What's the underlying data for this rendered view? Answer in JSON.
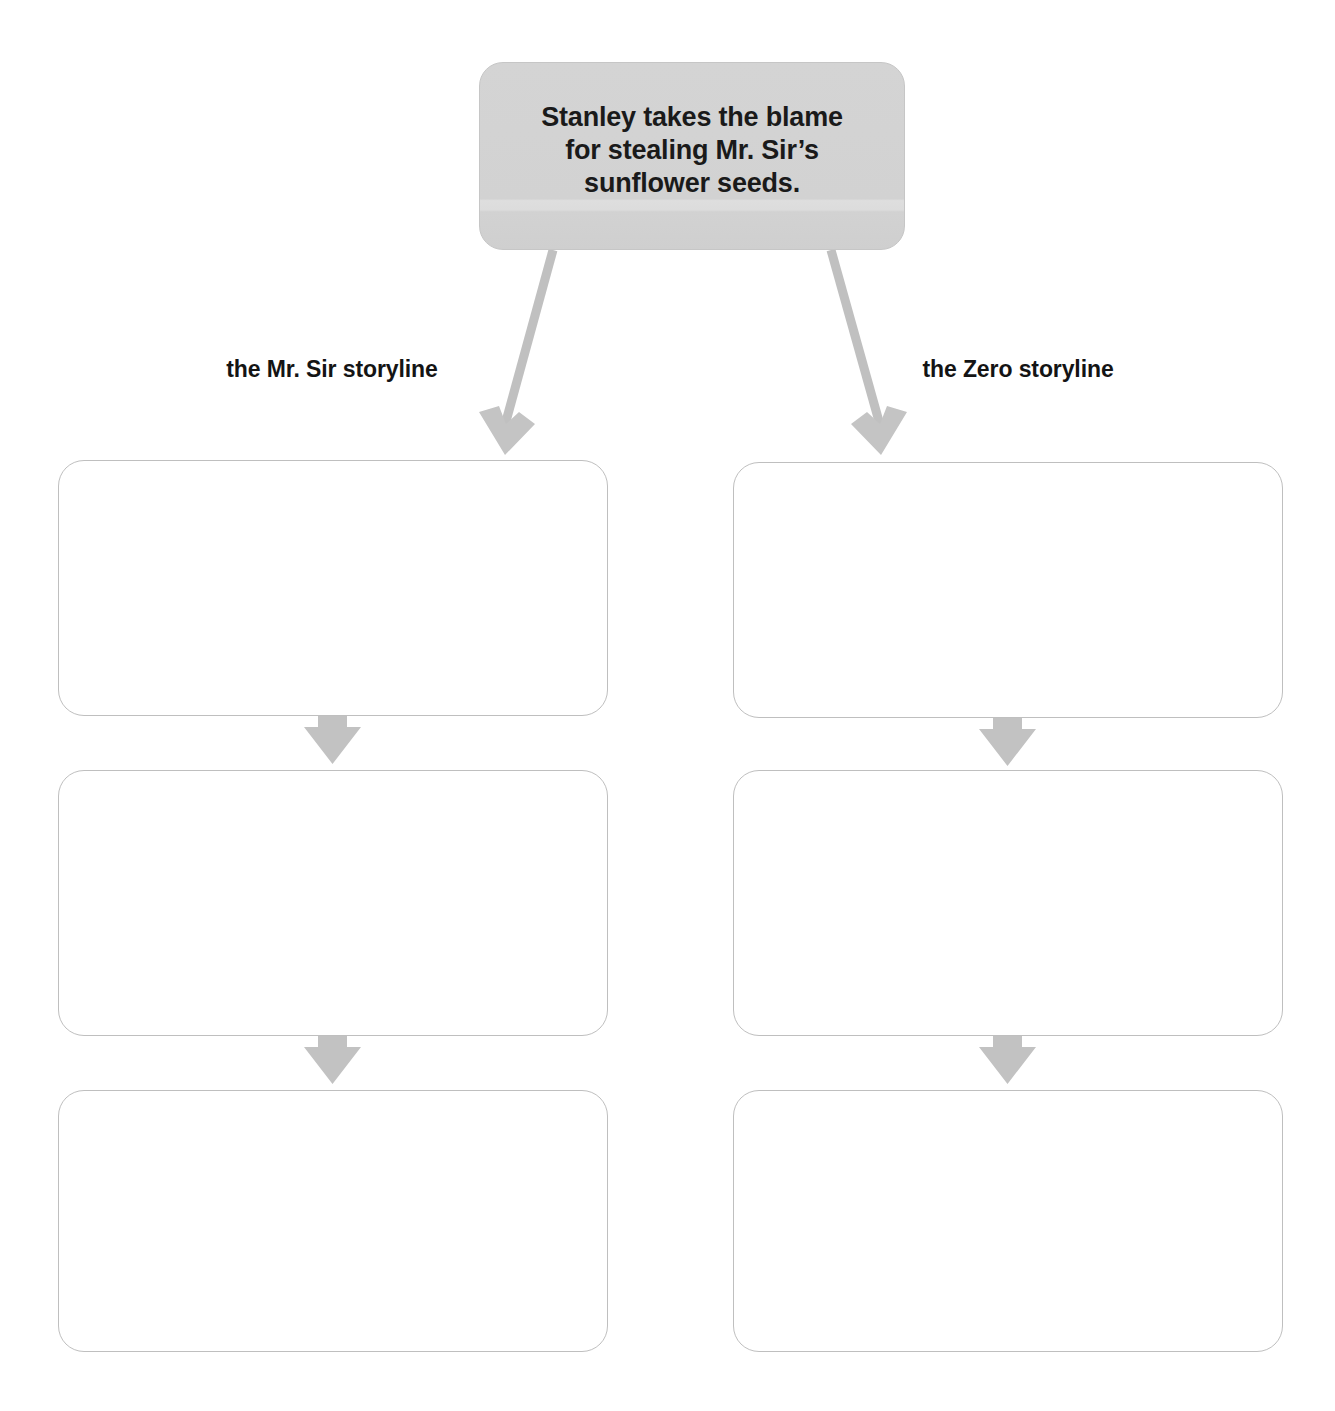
{
  "page": {
    "type": "graphic-organizer",
    "title_box": {
      "text": "Stanley takes the blame for stealing Mr. Sir’s sunflower seeds.",
      "fill_color": "#d4d4d4",
      "border_color": "#c6c6c6"
    },
    "columns": [
      {
        "id": "mr-sir",
        "caption": "the Mr. Sir storyline",
        "boxes": [
          {
            "id": "mr-sir-1",
            "text": ""
          },
          {
            "id": "mr-sir-2",
            "text": ""
          },
          {
            "id": "mr-sir-3",
            "text": ""
          }
        ]
      },
      {
        "id": "zero",
        "caption": "the Zero storyline",
        "boxes": [
          {
            "id": "zero-1",
            "text": ""
          },
          {
            "id": "zero-2",
            "text": ""
          },
          {
            "id": "zero-3",
            "text": ""
          }
        ]
      }
    ],
    "arrows": {
      "color": "#bcbcbc",
      "items": [
        {
          "name": "branch-arrow-left",
          "from": "title-box",
          "to": "mr-sir-1",
          "direction": "down-left"
        },
        {
          "name": "branch-arrow-right",
          "from": "title-box",
          "to": "zero-1",
          "direction": "down-right"
        },
        {
          "name": "flow-arrow-left-1",
          "from": "mr-sir-1",
          "to": "mr-sir-2",
          "direction": "down"
        },
        {
          "name": "flow-arrow-left-2",
          "from": "mr-sir-2",
          "to": "mr-sir-3",
          "direction": "down"
        },
        {
          "name": "flow-arrow-right-1",
          "from": "zero-1",
          "to": "zero-2",
          "direction": "down"
        },
        {
          "name": "flow-arrow-right-2",
          "from": "zero-2",
          "to": "zero-3",
          "direction": "down"
        }
      ]
    },
    "box_style": {
      "border_color": "#bfbfbf",
      "fill_color": "#ffffff"
    }
  }
}
